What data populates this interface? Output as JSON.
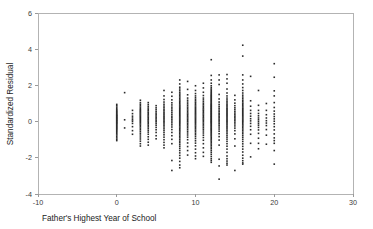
{
  "chart_data": {
    "type": "scatter",
    "title": "",
    "xlabel": "Father's Highest Year of School",
    "ylabel": "Standardized Residual",
    "xlim": [
      -10,
      30
    ],
    "ylim": [
      -4,
      6
    ],
    "xticks": [
      -10,
      0,
      10,
      20,
      30
    ],
    "xticklabels": [
      "-10",
      "0",
      "10",
      "20",
      "30"
    ],
    "yticks": [
      -4,
      -2,
      0,
      2,
      4,
      6
    ],
    "yticklabels": [
      "-4",
      "-2",
      "0",
      "2",
      "4",
      "6"
    ],
    "grid": false,
    "legend": null,
    "marker": "square",
    "marker_color": "#2b2b2b",
    "marker_size_px": 1.6,
    "frame_color": "#b3b3b3",
    "background": "#ffffff",
    "note": "Residual plot; observations occur only at integer years of school 0-20, forming vertical strips. Density peaks at 12, then 8, 16, 14.",
    "series": [
      {
        "name": "Standardized Residual",
        "columns": [
          {
            "x": 0,
            "n": 38,
            "ymin": -1.05,
            "ymax": 0.95,
            "y": [
              0.95,
              0.88,
              0.8,
              0.72,
              0.66,
              0.6,
              0.55,
              0.5,
              0.45,
              0.4,
              0.36,
              0.32,
              0.28,
              0.24,
              0.2,
              0.16,
              0.12,
              0.08,
              0.04,
              0.0,
              -0.04,
              -0.08,
              -0.12,
              -0.17,
              -0.22,
              -0.27,
              -0.32,
              -0.37,
              -0.42,
              -0.48,
              -0.54,
              -0.6,
              -0.67,
              -0.74,
              -0.82,
              -0.9,
              -0.98,
              -1.05
            ]
          },
          {
            "x": 1,
            "n": 3,
            "ymin": -0.35,
            "ymax": 1.6,
            "y": [
              1.6,
              0.1,
              -0.35
            ]
          },
          {
            "x": 2,
            "n": 10,
            "ymin": -0.7,
            "ymax": 0.62,
            "y": [
              0.62,
              0.44,
              0.3,
              0.2,
              0.1,
              0.02,
              -0.1,
              -0.28,
              -0.5,
              -0.7
            ]
          },
          {
            "x": 3,
            "n": 32,
            "ymin": -1.35,
            "ymax": 1.18,
            "y": [
              1.18,
              1.05,
              0.96,
              0.88,
              0.8,
              0.72,
              0.66,
              0.6,
              0.54,
              0.48,
              0.42,
              0.36,
              0.3,
              0.24,
              0.18,
              0.12,
              0.06,
              0.0,
              -0.06,
              -0.13,
              -0.2,
              -0.28,
              -0.36,
              -0.45,
              -0.54,
              -0.64,
              -0.74,
              -0.85,
              -0.96,
              -1.08,
              -1.22,
              -1.35
            ]
          },
          {
            "x": 4,
            "n": 26,
            "ymin": -1.3,
            "ymax": 1.05,
            "y": [
              1.05,
              0.94,
              0.84,
              0.75,
              0.67,
              0.6,
              0.52,
              0.45,
              0.38,
              0.31,
              0.24,
              0.17,
              0.1,
              0.03,
              -0.04,
              -0.12,
              -0.2,
              -0.29,
              -0.38,
              -0.48,
              -0.58,
              -0.7,
              -0.84,
              -0.98,
              -1.14,
              -1.3
            ]
          },
          {
            "x": 5,
            "n": 18,
            "ymin": -0.95,
            "ymax": 0.88,
            "y": [
              0.88,
              0.76,
              0.66,
              0.56,
              0.47,
              0.39,
              0.31,
              0.23,
              0.15,
              0.07,
              -0.01,
              -0.1,
              -0.2,
              -0.32,
              -0.45,
              -0.6,
              -0.78,
              -0.95
            ]
          },
          {
            "x": 6,
            "n": 30,
            "ymin": -1.45,
            "ymax": 1.72,
            "y": [
              1.72,
              1.42,
              1.22,
              1.08,
              0.96,
              0.86,
              0.77,
              0.68,
              0.6,
              0.52,
              0.44,
              0.37,
              0.3,
              0.23,
              0.16,
              0.09,
              0.02,
              -0.05,
              -0.13,
              -0.21,
              -0.3,
              -0.4,
              -0.5,
              -0.61,
              -0.73,
              -0.86,
              -1.0,
              -1.15,
              -1.3,
              -1.45
            ]
          },
          {
            "x": 7,
            "n": 24,
            "ymin": -2.7,
            "ymax": 1.62,
            "y": [
              1.62,
              1.4,
              1.2,
              1.04,
              0.92,
              0.8,
              0.7,
              0.6,
              0.5,
              0.4,
              0.3,
              0.21,
              0.12,
              0.03,
              -0.07,
              -0.18,
              -0.3,
              -0.44,
              -0.6,
              -0.78,
              -0.98,
              -1.22,
              -2.15,
              -2.7
            ]
          },
          {
            "x": 8,
            "n": 56,
            "ymin": -2.55,
            "ymax": 2.3,
            "y": [
              2.3,
              2.08,
              1.9,
              1.8,
              1.7,
              1.6,
              1.52,
              1.44,
              1.36,
              1.28,
              1.2,
              1.13,
              1.06,
              0.99,
              0.92,
              0.86,
              0.8,
              0.74,
              0.68,
              0.62,
              0.56,
              0.5,
              0.44,
              0.38,
              0.32,
              0.26,
              0.2,
              0.14,
              0.08,
              0.02,
              -0.04,
              -0.1,
              -0.16,
              -0.23,
              -0.3,
              -0.37,
              -0.44,
              -0.51,
              -0.58,
              -0.66,
              -0.74,
              -0.82,
              -0.9,
              -0.99,
              -1.08,
              -1.17,
              -1.27,
              -1.37,
              -1.48,
              -1.6,
              -1.73,
              -1.87,
              -2.02,
              -2.2,
              -2.4,
              -2.55
            ]
          },
          {
            "x": 9,
            "n": 34,
            "ymin": -1.85,
            "ymax": 2.22,
            "y": [
              2.22,
              1.78,
              1.48,
              1.3,
              1.18,
              1.08,
              0.98,
              0.89,
              0.8,
              0.72,
              0.64,
              0.56,
              0.48,
              0.41,
              0.34,
              0.27,
              0.2,
              0.13,
              0.06,
              -0.01,
              -0.09,
              -0.17,
              -0.25,
              -0.34,
              -0.43,
              -0.53,
              -0.63,
              -0.74,
              -0.86,
              -1.0,
              -1.18,
              -1.38,
              -1.6,
              -1.85
            ]
          },
          {
            "x": 10,
            "n": 44,
            "ymin": -2.05,
            "ymax": 1.98,
            "y": [
              1.98,
              1.72,
              1.55,
              1.42,
              1.32,
              1.23,
              1.15,
              1.07,
              1.0,
              0.93,
              0.86,
              0.79,
              0.73,
              0.67,
              0.61,
              0.55,
              0.49,
              0.43,
              0.37,
              0.31,
              0.25,
              0.19,
              0.13,
              0.07,
              0.01,
              -0.05,
              -0.11,
              -0.18,
              -0.25,
              -0.32,
              -0.39,
              -0.47,
              -0.55,
              -0.64,
              -0.73,
              -0.83,
              -0.94,
              -1.06,
              -1.19,
              -1.34,
              -1.52,
              -1.72,
              -1.9,
              -2.05
            ]
          },
          {
            "x": 11,
            "n": 36,
            "ymin": -1.92,
            "ymax": 2.12,
            "y": [
              2.12,
              1.86,
              1.62,
              1.44,
              1.3,
              1.2,
              1.1,
              1.01,
              0.93,
              0.85,
              0.77,
              0.7,
              0.63,
              0.56,
              0.49,
              0.42,
              0.35,
              0.28,
              0.21,
              0.14,
              0.07,
              0.0,
              -0.08,
              -0.16,
              -0.24,
              -0.33,
              -0.42,
              -0.52,
              -0.63,
              -0.75,
              -0.88,
              -1.03,
              -1.22,
              -1.45,
              -1.7,
              -1.92
            ]
          },
          {
            "x": 12,
            "n": 78,
            "ymin": -2.25,
            "ymax": 3.42,
            "y": [
              3.42,
              2.55,
              2.3,
              2.12,
              1.98,
              1.88,
              1.8,
              1.73,
              1.66,
              1.6,
              1.54,
              1.48,
              1.43,
              1.38,
              1.33,
              1.28,
              1.23,
              1.18,
              1.13,
              1.08,
              1.03,
              0.98,
              0.94,
              0.9,
              0.86,
              0.82,
              0.78,
              0.74,
              0.7,
              0.66,
              0.62,
              0.58,
              0.54,
              0.5,
              0.46,
              0.42,
              0.38,
              0.34,
              0.3,
              0.26,
              0.22,
              0.18,
              0.14,
              0.1,
              0.06,
              0.02,
              -0.02,
              -0.06,
              -0.1,
              -0.15,
              -0.2,
              -0.25,
              -0.3,
              -0.35,
              -0.4,
              -0.45,
              -0.5,
              -0.56,
              -0.62,
              -0.68,
              -0.74,
              -0.8,
              -0.87,
              -0.94,
              -1.01,
              -1.08,
              -1.16,
              -1.24,
              -1.32,
              -1.41,
              -1.5,
              -1.6,
              -1.7,
              -1.81,
              -1.93,
              -2.05,
              -2.15,
              -2.25
            ]
          },
          {
            "x": 13,
            "n": 30,
            "ymin": -3.18,
            "ymax": 2.58,
            "y": [
              2.58,
              2.3,
              2.05,
              1.5,
              1.25,
              1.08,
              0.95,
              0.84,
              0.74,
              0.64,
              0.55,
              0.46,
              0.38,
              0.3,
              0.22,
              0.14,
              0.06,
              -0.02,
              -0.11,
              -0.2,
              -0.3,
              -0.41,
              -0.53,
              -0.67,
              -0.83,
              -1.02,
              -1.3,
              -2.08,
              -2.45,
              -3.18
            ]
          },
          {
            "x": 14,
            "n": 48,
            "ymin": -2.4,
            "ymax": 2.6,
            "y": [
              2.6,
              2.36,
              2.12,
              1.8,
              1.58,
              1.42,
              1.3,
              1.2,
              1.11,
              1.03,
              0.95,
              0.88,
              0.81,
              0.74,
              0.68,
              0.62,
              0.56,
              0.5,
              0.44,
              0.38,
              0.32,
              0.26,
              0.2,
              0.14,
              0.08,
              0.02,
              -0.04,
              -0.11,
              -0.18,
              -0.25,
              -0.32,
              -0.4,
              -0.48,
              -0.57,
              -0.66,
              -0.76,
              -0.86,
              -0.97,
              -1.09,
              -1.22,
              -1.36,
              -1.52,
              -1.7,
              -1.9,
              -2.05,
              -2.18,
              -2.3,
              -2.4
            ]
          },
          {
            "x": 15,
            "n": 22,
            "ymin": -2.7,
            "ymax": 1.45,
            "y": [
              1.45,
              1.2,
              1.02,
              0.88,
              0.76,
              0.66,
              0.56,
              0.47,
              0.38,
              0.3,
              0.22,
              0.14,
              0.06,
              -0.03,
              -0.13,
              -0.24,
              -0.36,
              -0.5,
              -0.68,
              -0.95,
              -1.35,
              -2.7
            ]
          },
          {
            "x": 16,
            "n": 52,
            "ymin": -2.35,
            "ymax": 4.22,
            "y": [
              4.22,
              3.62,
              2.58,
              2.3,
              2.08,
              1.88,
              1.72,
              1.58,
              1.46,
              1.36,
              1.27,
              1.18,
              1.1,
              1.02,
              0.95,
              0.88,
              0.81,
              0.74,
              0.68,
              0.62,
              0.56,
              0.5,
              0.44,
              0.38,
              0.32,
              0.26,
              0.2,
              0.14,
              0.08,
              0.02,
              -0.04,
              -0.11,
              -0.18,
              -0.25,
              -0.33,
              -0.41,
              -0.49,
              -0.58,
              -0.67,
              -0.77,
              -0.87,
              -0.98,
              -1.1,
              -1.23,
              -1.37,
              -1.52,
              -1.68,
              -1.86,
              -2.02,
              -2.16,
              -2.28,
              -2.35
            ]
          },
          {
            "x": 17,
            "n": 14,
            "ymin": -1.95,
            "ymax": 2.5,
            "y": [
              2.5,
              1.15,
              0.85,
              0.62,
              0.45,
              0.3,
              0.16,
              0.04,
              -0.1,
              -0.26,
              -0.45,
              -0.7,
              -1.2,
              -1.95
            ]
          },
          {
            "x": 18,
            "n": 16,
            "ymin": -1.5,
            "ymax": 1.72,
            "y": [
              1.72,
              0.9,
              0.62,
              0.45,
              0.32,
              0.2,
              0.1,
              0.0,
              -0.1,
              -0.2,
              -0.32,
              -0.46,
              -0.65,
              -0.92,
              -1.2,
              -1.5
            ]
          },
          {
            "x": 19,
            "n": 10,
            "ymin": -1.25,
            "ymax": 1.0,
            "y": [
              1.0,
              0.62,
              0.38,
              0.2,
              0.05,
              -0.08,
              -0.22,
              -0.44,
              -0.75,
              -1.25
            ]
          },
          {
            "x": 20,
            "n": 20,
            "ymin": -2.35,
            "ymax": 3.2,
            "y": [
              3.2,
              2.45,
              1.7,
              1.42,
              1.05,
              0.78,
              0.58,
              0.42,
              0.28,
              0.15,
              0.02,
              -0.12,
              -0.28,
              -0.46,
              -0.68,
              -0.9,
              -1.05,
              -1.2,
              -1.6,
              -2.35
            ]
          }
        ]
      }
    ]
  }
}
